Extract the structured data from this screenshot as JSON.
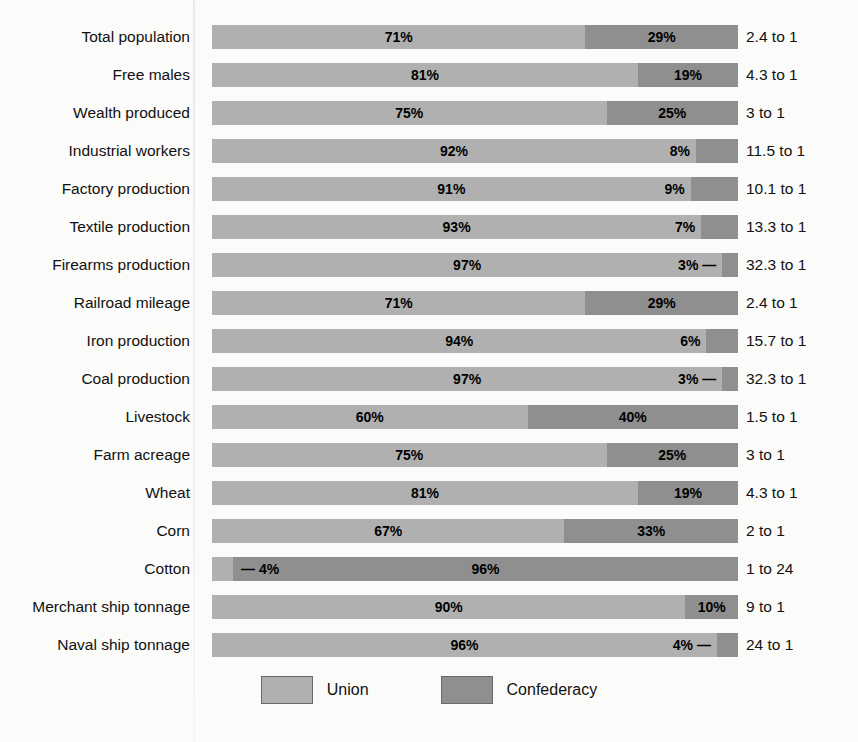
{
  "title": "",
  "legend": {
    "union_label": "Union",
    "confederacy_label": "Confederacy",
    "union_color": "#b0b0b0",
    "confederacy_color": "#8f8f8f"
  },
  "chart_data": {
    "type": "bar",
    "subtype": "100% stacked horizontal bar",
    "title": "",
    "xlabel": "",
    "ylabel": "",
    "xlim": [
      0,
      100
    ],
    "grid": false,
    "legend_position": "bottom-center",
    "series": [
      {
        "name": "Union",
        "color": "#b0b0b0",
        "values": [
          71,
          81,
          75,
          92,
          91,
          93,
          97,
          71,
          94,
          97,
          60,
          75,
          81,
          67,
          4,
          90,
          96
        ]
      },
      {
        "name": "Confederacy",
        "color": "#8f8f8f",
        "values": [
          29,
          19,
          25,
          8,
          9,
          7,
          3,
          29,
          6,
          3,
          40,
          25,
          19,
          33,
          96,
          10,
          4
        ]
      }
    ],
    "categories": [
      "Total population",
      "Free males",
      "Wealth produced",
      "Industrial workers",
      "Factory production",
      "Textile production",
      "Firearms production",
      "Railroad mileage",
      "Iron production",
      "Coal production",
      "Livestock",
      "Farm acreage",
      "Wheat",
      "Corn",
      "Cotton",
      "Merchant ship tonnage",
      "Naval ship tonnage"
    ],
    "annotations": [
      "2.4 to 1",
      "4.3 to 1",
      "3 to 1",
      "11.5 to 1",
      "10.1 to 1",
      "13.3 to 1",
      "32.3 to 1",
      "2.4 to 1",
      "15.7 to 1",
      "32.3 to 1",
      "1.5 to 1",
      "3 to 1",
      "4.3 to 1",
      "2 to 1",
      "1 to 24",
      "9 to 1",
      "24 to 1"
    ]
  },
  "rows": [
    {
      "label": "Total population",
      "union_pct": 71,
      "conf_pct": 29,
      "union_text": "71%",
      "conf_text": "29%",
      "ratio": "2.4 to 1",
      "union_outside": false,
      "conf_outside": false
    },
    {
      "label": "Free males",
      "union_pct": 81,
      "conf_pct": 19,
      "union_text": "81%",
      "conf_text": "19%",
      "ratio": "4.3 to 1",
      "union_outside": false,
      "conf_outside": false
    },
    {
      "label": "Wealth produced",
      "union_pct": 75,
      "conf_pct": 25,
      "union_text": "75%",
      "conf_text": "25%",
      "ratio": "3 to 1",
      "union_outside": false,
      "conf_outside": false
    },
    {
      "label": "Industrial workers",
      "union_pct": 92,
      "conf_pct": 8,
      "union_text": "92%",
      "conf_text": "8%",
      "ratio": "11.5 to 1",
      "union_outside": false,
      "conf_outside": true
    },
    {
      "label": "Factory production",
      "union_pct": 91,
      "conf_pct": 9,
      "union_text": "91%",
      "conf_text": "9%",
      "ratio": "10.1 to 1",
      "union_outside": false,
      "conf_outside": true
    },
    {
      "label": "Textile production",
      "union_pct": 93,
      "conf_pct": 7,
      "union_text": "93%",
      "conf_text": "7%",
      "ratio": "13.3 to 1",
      "union_outside": false,
      "conf_outside": true
    },
    {
      "label": "Firearms production",
      "union_pct": 97,
      "conf_pct": 3,
      "union_text": "97%",
      "conf_text": "3% —",
      "ratio": "32.3 to 1",
      "union_outside": false,
      "conf_outside": true
    },
    {
      "label": "Railroad mileage",
      "union_pct": 71,
      "conf_pct": 29,
      "union_text": "71%",
      "conf_text": "29%",
      "ratio": "2.4 to 1",
      "union_outside": false,
      "conf_outside": false
    },
    {
      "label": "Iron production",
      "union_pct": 94,
      "conf_pct": 6,
      "union_text": "94%",
      "conf_text": "6%",
      "ratio": "15.7 to 1",
      "union_outside": false,
      "conf_outside": true
    },
    {
      "label": "Coal production",
      "union_pct": 97,
      "conf_pct": 3,
      "union_text": "97%",
      "conf_text": "3% —",
      "ratio": "32.3 to 1",
      "union_outside": false,
      "conf_outside": true
    },
    {
      "label": "Livestock",
      "union_pct": 60,
      "conf_pct": 40,
      "union_text": "60%",
      "conf_text": "40%",
      "ratio": "1.5 to 1",
      "union_outside": false,
      "conf_outside": false
    },
    {
      "label": "Farm acreage",
      "union_pct": 75,
      "conf_pct": 25,
      "union_text": "75%",
      "conf_text": "25%",
      "ratio": "3 to 1",
      "union_outside": false,
      "conf_outside": false
    },
    {
      "label": "Wheat",
      "union_pct": 81,
      "conf_pct": 19,
      "union_text": "81%",
      "conf_text": "19%",
      "ratio": "4.3 to 1",
      "union_outside": false,
      "conf_outside": false
    },
    {
      "label": "Corn",
      "union_pct": 67,
      "conf_pct": 33,
      "union_text": "67%",
      "conf_text": "33%",
      "ratio": "2 to 1",
      "union_outside": false,
      "conf_outside": false
    },
    {
      "label": "Cotton",
      "union_pct": 4,
      "conf_pct": 96,
      "union_text": "— 4%",
      "conf_text": "96%",
      "ratio": "1 to 24",
      "union_outside": true,
      "conf_outside": false
    },
    {
      "label": "Merchant ship tonnage",
      "union_pct": 90,
      "conf_pct": 10,
      "union_text": "90%",
      "conf_text": "10%",
      "ratio": "9 to 1",
      "union_outside": false,
      "conf_outside": false
    },
    {
      "label": "Naval ship tonnage",
      "union_pct": 96,
      "conf_pct": 4,
      "union_text": "96%",
      "conf_text": "4% —",
      "ratio": "24 to 1",
      "union_outside": false,
      "conf_outside": true
    }
  ]
}
